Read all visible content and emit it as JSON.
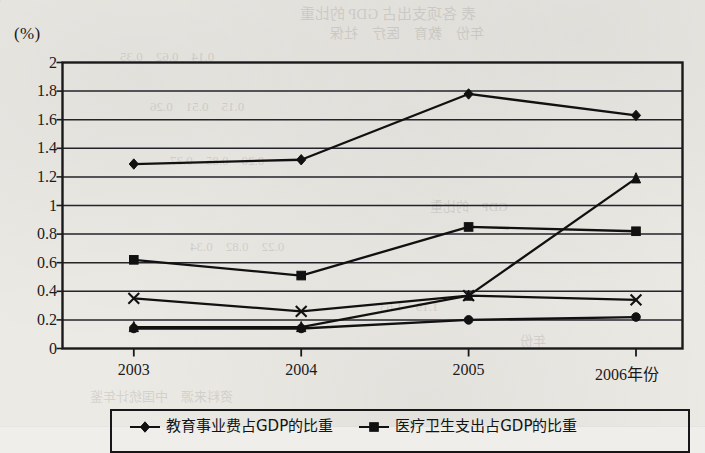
{
  "figure": {
    "unit_label": "(%)",
    "x_axis_title": "年份",
    "background_note": "scanned textbook page"
  },
  "chart_data": {
    "type": "line",
    "title": "",
    "xlabel": "年份",
    "ylabel": "(%)",
    "x": [
      "2003",
      "2004",
      "2005",
      "2006"
    ],
    "categories": [
      "2003",
      "2004",
      "2005",
      "2006"
    ],
    "ylim": [
      0,
      2
    ],
    "ytick_labels": [
      "0",
      "0.2",
      "0.4",
      "0.6",
      "0.8",
      "1",
      "1.2",
      "1.4",
      "1.6",
      "1.8",
      "2"
    ],
    "ytick_values": [
      0,
      0.2,
      0.4,
      0.6,
      0.8,
      1,
      1.2,
      1.4,
      1.6,
      1.8,
      2
    ],
    "grid": true,
    "legend_position": "bottom",
    "series": [
      {
        "name": "教育事业费占GDP的比重",
        "marker": "diamond",
        "values": [
          1.29,
          1.32,
          1.78,
          1.63
        ]
      },
      {
        "name": "医疗卫生支出占GDP的比重",
        "marker": "square",
        "values": [
          0.62,
          0.51,
          0.85,
          0.82
        ]
      },
      {
        "name": "",
        "marker": "cross",
        "values": [
          0.35,
          0.26,
          0.37,
          0.34
        ]
      },
      {
        "name": "",
        "marker": "triangle",
        "values": [
          0.15,
          0.15,
          0.37,
          1.19
        ]
      },
      {
        "name": "",
        "marker": "circle",
        "values": [
          0.14,
          0.14,
          0.2,
          0.22
        ]
      }
    ]
  },
  "legend": {
    "items": [
      {
        "label": "教育事业费占GDP的比重",
        "marker": "diamond"
      },
      {
        "label": "医疗卫生支出占GDP的比重",
        "marker": "square"
      }
    ]
  },
  "bleed_through": [
    "表",
    "费",
    "GDP",
    "的比重"
  ]
}
